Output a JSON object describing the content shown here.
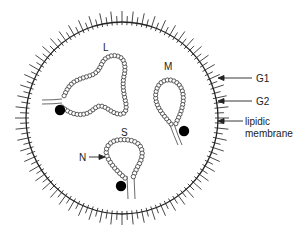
{
  "figure": {
    "type": "virion-schematic",
    "colors": {
      "stroke": "#222222",
      "background": "#ffffff",
      "bead_fill": "#ffffff",
      "dot_fill": "#000000"
    },
    "envelope": {
      "center": [
        122,
        118
      ],
      "radius": 96,
      "spike_count": 120
    },
    "segments": [
      {
        "id": "L",
        "label": "L",
        "label_pos": [
          103,
          42
        ]
      },
      {
        "id": "M",
        "label": "M",
        "label_pos": [
          164,
          61
        ]
      },
      {
        "id": "S",
        "label": "S",
        "label_pos": [
          121,
          127
        ]
      }
    ],
    "annotations": [
      {
        "id": "G1",
        "label": "G1",
        "pos": [
          256,
          73
        ]
      },
      {
        "id": "G2",
        "label": "G2",
        "pos": [
          256,
          96
        ]
      },
      {
        "id": "membrane",
        "label_line1": "lipidic",
        "label_line2": "membrane",
        "pos": [
          245,
          117
        ]
      },
      {
        "id": "N",
        "label": "N",
        "pos": [
          79,
          152
        ]
      }
    ]
  }
}
